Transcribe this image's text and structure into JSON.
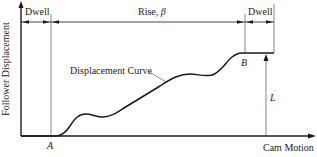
{
  "diagram": {
    "type": "cam displacement diagram",
    "y_axis_label": "Follower Displacement",
    "x_axis_label": "Cam Motion",
    "intervals": [
      {
        "label": "Dwell"
      },
      {
        "label": "Rise, ",
        "symbol": "β"
      },
      {
        "label": "Dwell"
      }
    ],
    "curve_label": "Displacement Curve",
    "points": {
      "start": "A",
      "end": "B"
    },
    "lift_label": "L",
    "colors": {
      "line": "#1a1a1a",
      "thin_line": "#555555",
      "background": "#ffffff"
    }
  }
}
